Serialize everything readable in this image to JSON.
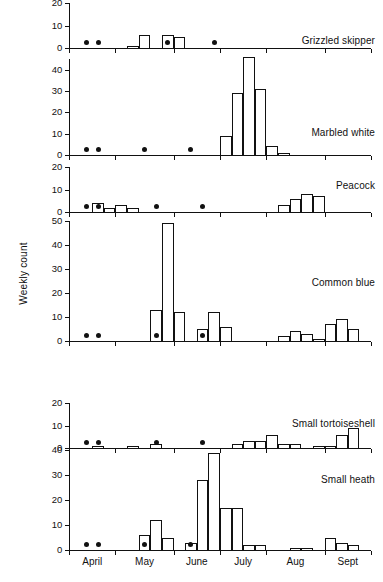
{
  "figure": {
    "ylabel": "Weekly count",
    "xlabel": "",
    "caption": ""
  },
  "months": [
    {
      "label": "April",
      "weeks": 4
    },
    {
      "label": "May",
      "weeks": 5
    },
    {
      "label": "June",
      "weeks": 4
    },
    {
      "label": "July",
      "weeks": 4
    },
    {
      "label": "Aug",
      "weeks": 5
    },
    {
      "label": "Sept",
      "weeks": 4
    }
  ],
  "chart_data": {
    "type": "bar",
    "title": "",
    "xlabel": "",
    "ylabel": "Weekly count",
    "grid": false,
    "legend_position": "inside-right",
    "x_tick_labels": [
      "April",
      "May",
      "June",
      "July",
      "Aug",
      "Sept"
    ],
    "n_weeks": 26,
    "note": "Six stacked panels of weekly butterfly counts. Black dots mark weeks with no recorded count.",
    "panels": [
      {
        "name": "Grizzled skipper",
        "ylim": [
          0,
          20
        ],
        "yticks": [
          0,
          10,
          20
        ],
        "values": [
          0,
          0,
          0,
          0,
          0,
          1,
          6,
          0,
          6,
          5,
          0,
          0,
          0,
          0,
          0,
          0,
          0,
          0,
          0,
          0,
          0,
          0,
          0,
          0,
          0,
          0
        ],
        "dot_weeks": [
          1,
          2,
          8,
          12
        ]
      },
      {
        "name": "Marbled white",
        "ylim": [
          0,
          45
        ],
        "yticks": [
          0,
          10,
          20,
          30,
          40
        ],
        "values": [
          0,
          0,
          0,
          0,
          0,
          0,
          0,
          0,
          0,
          0,
          0,
          0,
          0,
          9,
          29,
          46,
          31,
          4,
          1,
          0,
          0,
          0,
          0,
          0,
          0,
          0
        ],
        "dot_weeks": [
          1,
          2,
          6,
          10
        ]
      },
      {
        "name": "Peacock",
        "ylim": [
          0,
          20
        ],
        "yticks": [
          0,
          10,
          20
        ],
        "values": [
          0,
          0,
          4,
          2,
          3,
          2,
          0,
          0,
          0,
          0,
          0,
          0,
          0,
          0,
          0,
          0,
          0,
          0,
          3,
          6,
          8,
          7,
          0,
          0,
          0,
          0
        ],
        "dot_weeks": [
          1,
          2,
          7,
          11
        ]
      },
      {
        "name": "Common blue",
        "ylim": [
          0,
          50
        ],
        "yticks": [
          0,
          10,
          20,
          30,
          40,
          50
        ],
        "values": [
          0,
          0,
          0,
          0,
          0,
          0,
          0,
          13,
          49,
          12,
          0,
          5,
          12,
          6,
          0,
          0,
          0,
          0,
          2,
          4,
          3,
          1,
          7,
          9,
          5,
          0
        ],
        "dot_weeks": [
          1,
          2,
          7,
          11
        ]
      },
      {
        "name": "Small tortoiseshell",
        "ylim": [
          0,
          20
        ],
        "yticks": [
          0,
          10,
          20
        ],
        "values": [
          0,
          0,
          1,
          0,
          0,
          1,
          0,
          2,
          0,
          0,
          0,
          0,
          0,
          0,
          2,
          3,
          3,
          6,
          2,
          2,
          0,
          1,
          1,
          6,
          9,
          0
        ],
        "dot_weeks": [
          1,
          2,
          7,
          11
        ]
      },
      {
        "name": "Small heath",
        "ylim": [
          0,
          40
        ],
        "yticks": [
          0,
          10,
          20,
          30,
          40
        ],
        "values": [
          0,
          0,
          0,
          0,
          0,
          0,
          6,
          12,
          5,
          0,
          3,
          28,
          39,
          17,
          17,
          2,
          2,
          0,
          0,
          1,
          1,
          0,
          5,
          3,
          2,
          0
        ],
        "dot_weeks": [
          1,
          2,
          6,
          10
        ]
      }
    ]
  }
}
